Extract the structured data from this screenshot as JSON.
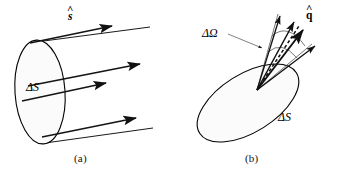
{
  "figure": {
    "background_color": "#ffffff",
    "stroke_color": "#000000",
    "disk_fill_color": "#fbfbfb",
    "ray_color": "#1a1a1a",
    "cone_line_color": "#555555"
  },
  "panels": [
    {
      "id": "a",
      "caption": "(a)",
      "caption_x": 74,
      "caption_y": 152,
      "description": "Flat disk surface element with parallel rays leaving along direction s-hat",
      "surface_label": "ΔS",
      "surface_label_x": 26,
      "surface_label_y": 80,
      "direction_label": "s",
      "direction_label_accent": "^",
      "direction_label_x": 68,
      "direction_label_y": 10,
      "ray_count": 4
    },
    {
      "id": "b",
      "caption": "(b)",
      "caption_x": 245,
      "caption_y": 152,
      "description": "Tilted disk surface element with a pencil of rays within solid angle delta-omega about direction q-hat",
      "surface_label": "ΔS",
      "surface_label_x": 278,
      "surface_label_y": 110,
      "solid_angle_label": "ΔΩ",
      "solid_angle_label_x": 202,
      "solid_angle_label_y": 26,
      "direction_label": "q",
      "direction_label_accent": "^",
      "direction_label_x": 306,
      "direction_label_y": 8,
      "ray_count": 4
    }
  ]
}
